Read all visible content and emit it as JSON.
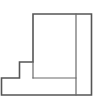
{
  "figure": {
    "background_color": "#ffffff",
    "outline_color": "#555555",
    "interior_line_color": "#6a6a6a",
    "fill_color": "#ffffff",
    "outline_stroke_width": 1.6,
    "interior_stroke_width": 1.2,
    "view_box": "0 0 106 104",
    "outline_points": "33,14 91.5,14 91.5,95 1.5,95 1.5,78 19.5,78 19.5,62 33,62",
    "interior_lines": [
      {
        "name": "riser-edge-step",
        "x1": 33,
        "y1": 62,
        "x2": 33,
        "y2": 78
      },
      {
        "name": "shelf-line-base-top",
        "x1": 33,
        "y1": 78,
        "x2": 76,
        "y2": 78
      },
      {
        "name": "vertical-divider-right",
        "x1": 76,
        "y1": 14,
        "x2": 76,
        "y2": 95
      }
    ]
  }
}
